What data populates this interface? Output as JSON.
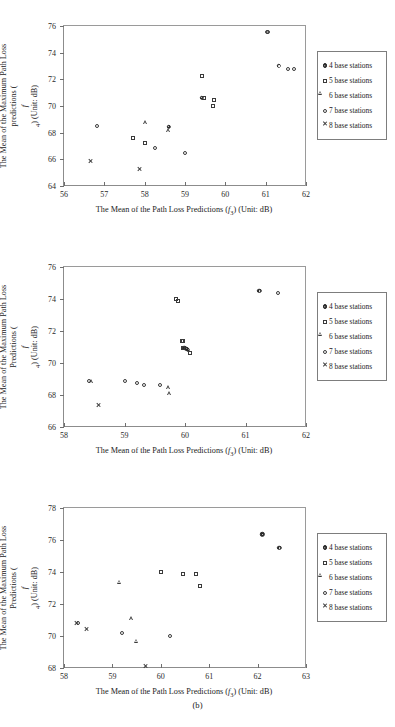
{
  "figure": {
    "caption": "(b)",
    "legend_entries": [
      {
        "label": "4 base stations",
        "marker": "filled-circle-dot"
      },
      {
        "label": "5 base stations",
        "marker": "open-square"
      },
      {
        "label": "6 base stations",
        "marker": "open-triangle"
      },
      {
        "label": "7 base stations",
        "marker": "open-circle"
      },
      {
        "label": "8 base stations",
        "marker": "cross-x"
      }
    ]
  },
  "chart_data": [
    {
      "type": "scatter",
      "title": "",
      "xlabel": "The Mean of the Path Loss Predictions (f3) (Unit: dB)",
      "ylabel": "The Mean of the Maximum Path Loss predictions (f4) (Unit: dB)",
      "xlim": [
        56,
        62
      ],
      "ylim": [
        64,
        76
      ],
      "xticks": [
        56,
        57,
        58,
        59,
        60,
        61,
        62
      ],
      "yticks": [
        64,
        66,
        68,
        70,
        72,
        74,
        76
      ],
      "grid": false,
      "legend_position": "right-outside",
      "series": [
        {
          "name": "4 base stations",
          "marker": "filled-circle-dot",
          "points": [
            [
              59.41,
              70.62
            ],
            [
              61.33,
              73.0
            ],
            [
              58.6,
              68.45
            ]
          ]
        },
        {
          "name": "5 base stations",
          "marker": "open-square",
          "points": [
            [
              57.72,
              67.6
            ],
            [
              58.0,
              67.22
            ],
            [
              59.42,
              72.22
            ],
            [
              59.48,
              70.6
            ],
            [
              59.72,
              70.42
            ],
            [
              59.7,
              70.0
            ]
          ]
        },
        {
          "name": "6 base stations",
          "marker": "open-triangle",
          "points": [
            [
              58.02,
              68.78
            ],
            [
              58.6,
              68.5
            ]
          ]
        },
        {
          "name": "7 base stations",
          "marker": "open-circle",
          "points": [
            [
              56.82,
              68.5
            ],
            [
              58.25,
              66.85
            ],
            [
              59.0,
              66.5
            ],
            [
              61.03,
              75.55
            ],
            [
              61.07,
              75.55
            ],
            [
              61.55,
              72.77
            ],
            [
              61.7,
              72.75
            ]
          ]
        },
        {
          "name": "8 base stations",
          "marker": "cross-x",
          "points": [
            [
              56.65,
              66.45
            ],
            [
              57.88,
              66.27
            ]
          ]
        }
      ]
    },
    {
      "type": "scatter",
      "title": "",
      "xlabel": "The Mean of the Path Loss Predictions (f3) (Unit: dB)",
      "ylabel": "The Mean of the Maximum Path Loss Predictions (f4) (Unit: dB)",
      "xlim": [
        58,
        62
      ],
      "ylim": [
        66,
        76
      ],
      "xticks": [
        58,
        59,
        60,
        61,
        62
      ],
      "yticks": [
        66,
        68,
        70,
        72,
        74,
        76
      ],
      "grid": false,
      "legend_position": "right-outside",
      "series": [
        {
          "name": "4 base stations",
          "marker": "filled-circle-dot",
          "points": [
            [
              61.23,
              74.5
            ],
            [
              60.05,
              70.82
            ],
            [
              60.02,
              70.88
            ],
            [
              59.99,
              70.95
            ]
          ]
        },
        {
          "name": "5 base stations",
          "marker": "open-square",
          "points": [
            [
              59.85,
              73.98
            ],
            [
              59.88,
              73.9
            ],
            [
              59.95,
              71.38
            ],
            [
              59.97,
              71.35
            ],
            [
              59.96,
              70.95
            ],
            [
              60.08,
              70.62
            ]
          ]
        },
        {
          "name": "6 base stations",
          "marker": "open-triangle",
          "points": [
            [
              58.45,
              68.88
            ],
            [
              59.73,
              68.72
            ],
            [
              59.75,
              68.6
            ]
          ]
        },
        {
          "name": "7 base stations",
          "marker": "open-circle",
          "points": [
            [
              58.42,
              68.88
            ],
            [
              59.0,
              68.88
            ],
            [
              59.2,
              68.78
            ],
            [
              59.33,
              68.65
            ],
            [
              59.58,
              68.62
            ],
            [
              61.53,
              74.35
            ]
          ]
        },
        {
          "name": "8 base stations",
          "marker": "cross-x",
          "points": [
            [
              58.57,
              68.1
            ]
          ]
        }
      ]
    },
    {
      "type": "scatter",
      "title": "",
      "xlabel": "The Mean of the Path Loss Predictions (f3) (Unit: dB)",
      "ylabel": "The Mean of the Maximum Path Loss Predictions (f4) (Unit: dB)",
      "xlim": [
        58,
        63
      ],
      "ylim": [
        68,
        78
      ],
      "xticks": [
        58,
        59,
        60,
        61,
        62,
        63
      ],
      "yticks": [
        68,
        70,
        72,
        74,
        76,
        78
      ],
      "grid": false,
      "legend_position": "right-outside",
      "series": [
        {
          "name": "4 base stations",
          "marker": "filled-circle-dot",
          "points": [
            [
              62.1,
              76.35
            ],
            [
              62.45,
              75.5
            ]
          ]
        },
        {
          "name": "5 base stations",
          "marker": "open-square",
          "points": [
            [
              60.0,
              74.02
            ],
            [
              60.45,
              73.88
            ],
            [
              60.73,
              73.87
            ],
            [
              60.82,
              73.1
            ]
          ]
        },
        {
          "name": "6 base stations",
          "marker": "open-triangle",
          "points": [
            [
              59.15,
              73.4
            ],
            [
              59.4,
              71.35
            ],
            [
              59.5,
              70.2
            ]
          ]
        },
        {
          "name": "7 base stations",
          "marker": "open-circle",
          "points": [
            [
              58.28,
              70.82
            ],
            [
              59.2,
              70.2
            ],
            [
              60.2,
              70.0
            ]
          ]
        },
        {
          "name": "8 base stations",
          "marker": "cross-x",
          "points": [
            [
              58.25,
              71.58
            ],
            [
              58.47,
              71.52
            ],
            [
              59.68,
              69.48
            ]
          ]
        }
      ]
    }
  ]
}
